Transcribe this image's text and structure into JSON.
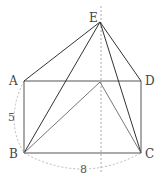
{
  "diagram": {
    "points": {
      "E": {
        "label": "E",
        "x": 100,
        "y": 22
      },
      "A": {
        "label": "A",
        "x": 24,
        "y": 81
      },
      "D": {
        "label": "D",
        "x": 141,
        "y": 81
      },
      "B": {
        "label": "B",
        "x": 24,
        "y": 153
      },
      "C": {
        "label": "C",
        "x": 141,
        "y": 153
      },
      "P": {
        "label": "",
        "x": 100,
        "y": 82
      }
    },
    "measurements": {
      "side_AB": "5",
      "side_BC": "8"
    },
    "colors": {
      "solid_line": "#333333",
      "dashed_line": "#aaaaaa",
      "thin_line": "#777777"
    }
  }
}
